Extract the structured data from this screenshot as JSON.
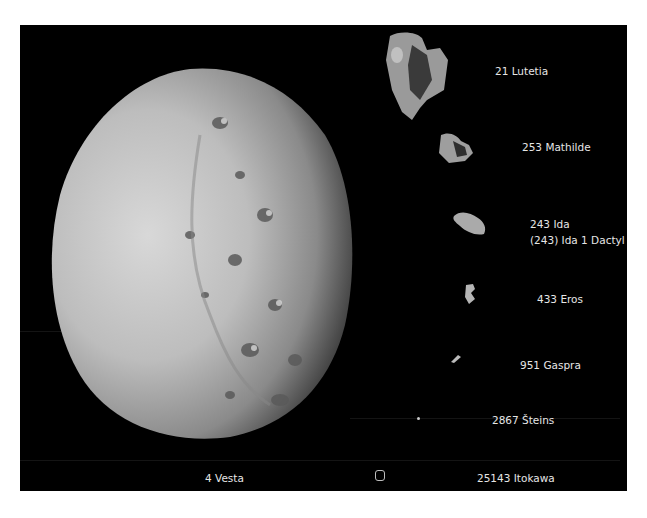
{
  "figure": {
    "background": "#000000",
    "label_color": "#e6e6e6",
    "bodies": [
      {
        "id": "vesta",
        "label": "4 Vesta"
      },
      {
        "id": "lutetia",
        "label": "21 Lutetia"
      },
      {
        "id": "mathilde",
        "label": "253 Mathilde"
      },
      {
        "id": "ida",
        "label": "243 Ida",
        "sublabel": "(243) Ida 1 Dactyl"
      },
      {
        "id": "eros",
        "label": "433 Eros"
      },
      {
        "id": "gaspra",
        "label": "951 Gaspra"
      },
      {
        "id": "steins",
        "label": "2867 Šteins"
      },
      {
        "id": "itokawa",
        "label": "25143 Itokawa"
      }
    ]
  }
}
